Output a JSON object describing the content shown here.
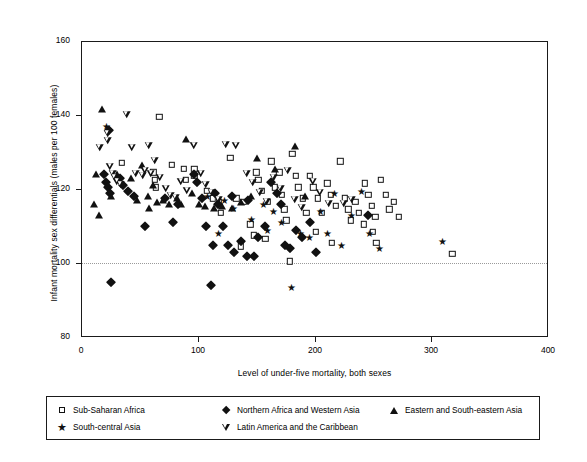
{
  "chart_data": {
    "type": "scatter",
    "title": "",
    "xlabel": "Level of under-five mortality, both sexes",
    "ylabel": "Infant mortality sex differentials (males per 100 females)",
    "xlim": [
      0,
      400
    ],
    "ylim": [
      80,
      160
    ],
    "xticks": [
      0,
      100,
      200,
      300,
      400
    ],
    "yticks": [
      80,
      100,
      120,
      140,
      160
    ],
    "grid": false,
    "reference_line": {
      "axis": "y",
      "value": 100,
      "style": "dotted",
      "color": "#9a9a9a"
    },
    "legend_position": "below-plot",
    "series": [
      {
        "name": "Sub-Saharan Africa",
        "marker": "open-square",
        "color": "#111111",
        "points": [
          [
            35,
            127
          ],
          [
            67,
            139.5
          ],
          [
            78,
            126.5
          ],
          [
            97,
            125.5
          ],
          [
            62,
            124.5
          ],
          [
            63,
            122.5
          ],
          [
            64,
            120.5
          ],
          [
            97,
            123.5
          ],
          [
            108,
            119.5
          ],
          [
            113,
            117.5
          ],
          [
            128,
            128.5
          ],
          [
            133,
            117.5
          ],
          [
            139,
            116.5
          ],
          [
            150,
            124.5
          ],
          [
            152,
            122.5
          ],
          [
            155,
            119.5
          ],
          [
            160,
            116.5
          ],
          [
            163,
            127.5
          ],
          [
            166,
            120.5
          ],
          [
            170,
            124.5
          ],
          [
            172,
            118.5
          ],
          [
            174,
            114.5
          ],
          [
            176,
            111.5
          ],
          [
            181,
            129.5
          ],
          [
            184,
            123.5
          ],
          [
            186,
            120.5
          ],
          [
            190,
            117.5
          ],
          [
            193,
            113.5
          ],
          [
            196,
            123.5
          ],
          [
            199,
            120.5
          ],
          [
            203,
            117.5
          ],
          [
            206,
            113.5
          ],
          [
            211,
            121.5
          ],
          [
            214,
            118.5
          ],
          [
            218,
            115.5
          ],
          [
            222,
            127.5
          ],
          [
            226,
            117.5
          ],
          [
            229,
            114.5
          ],
          [
            231,
            111.5
          ],
          [
            235,
            116.5
          ],
          [
            238,
            113.5
          ],
          [
            242,
            110.5
          ],
          [
            246,
            118.5
          ],
          [
            249,
            115.5
          ],
          [
            252,
            112.5
          ],
          [
            257,
            122.5
          ],
          [
            261,
            118.5
          ],
          [
            264,
            114.5
          ],
          [
            268,
            116.5
          ],
          [
            272,
            112.5
          ],
          [
            137,
            104.5
          ],
          [
            158,
            106.5
          ],
          [
            179,
            100.5
          ],
          [
            318,
            102.5
          ],
          [
            88,
            125.5
          ],
          [
            90,
            122.5
          ],
          [
            118,
            116.5
          ],
          [
            120,
            113.5
          ],
          [
            145,
            110.5
          ],
          [
            148,
            107.5
          ],
          [
            201,
            108.5
          ],
          [
            215,
            105.5
          ],
          [
            243,
            121.5
          ],
          [
            250,
            108.5
          ],
          [
            253,
            105.5
          ]
        ]
      },
      {
        "name": "South-central Asia",
        "marker": "star",
        "color": "#111111",
        "points": [
          [
            22,
            137
          ],
          [
            108,
            118
          ],
          [
            123,
            117
          ],
          [
            131,
            115
          ],
          [
            146,
            112
          ],
          [
            156,
            116
          ],
          [
            165,
            114
          ],
          [
            172,
            111
          ],
          [
            180,
            93.5
          ],
          [
            188,
            108
          ],
          [
            196,
            107
          ],
          [
            205,
            114
          ],
          [
            211,
            108
          ],
          [
            217,
            119
          ],
          [
            223,
            105
          ],
          [
            232,
            113
          ],
          [
            240,
            119.5
          ],
          [
            247,
            108
          ],
          [
            256,
            104
          ],
          [
            310,
            106
          ],
          [
            118,
            108
          ],
          [
            160,
            109
          ]
        ]
      },
      {
        "name": "Northern Africa and Western Asia",
        "marker": "filled-diamond",
        "color": "#111111",
        "points": [
          [
            20,
            124
          ],
          [
            21,
            122
          ],
          [
            23,
            120.5
          ],
          [
            25,
            119
          ],
          [
            24,
            136
          ],
          [
            26,
            95
          ],
          [
            33,
            123
          ],
          [
            36,
            121
          ],
          [
            40,
            119.5
          ],
          [
            45,
            118
          ],
          [
            55,
            110
          ],
          [
            72,
            117.5
          ],
          [
            79,
            111
          ],
          [
            83,
            116
          ],
          [
            97,
            124
          ],
          [
            99,
            122
          ],
          [
            104,
            117.5
          ],
          [
            107,
            110
          ],
          [
            111,
            94
          ],
          [
            113,
            105
          ],
          [
            117,
            116
          ],
          [
            122,
            110
          ],
          [
            126,
            105
          ],
          [
            131,
            103
          ],
          [
            137,
            106
          ],
          [
            142,
            102
          ],
          [
            148,
            102
          ],
          [
            152,
            107
          ],
          [
            158,
            110
          ],
          [
            163,
            122
          ],
          [
            168,
            119
          ],
          [
            171,
            116
          ],
          [
            175,
            105
          ],
          [
            179,
            104
          ],
          [
            184,
            109
          ],
          [
            189,
            107
          ],
          [
            196,
            111
          ],
          [
            201,
            103
          ],
          [
            246,
            113
          ],
          [
            115,
            119
          ],
          [
            129,
            118
          ],
          [
            143,
            117
          ]
        ]
      },
      {
        "name": "Eastern and South-eastern Asia",
        "marker": "filled-triangle-up",
        "color": "#111111",
        "points": [
          [
            13,
            124
          ],
          [
            11,
            116
          ],
          [
            15,
            113
          ],
          [
            18,
            141.5
          ],
          [
            31,
            124
          ],
          [
            43,
            123
          ],
          [
            52,
            126.5
          ],
          [
            57,
            118
          ],
          [
            62,
            121
          ],
          [
            65,
            116.5
          ],
          [
            70,
            117
          ],
          [
            75,
            116
          ],
          [
            82,
            117.5
          ],
          [
            90,
            133.5
          ],
          [
            95,
            119
          ],
          [
            101,
            116
          ],
          [
            106,
            115.5
          ],
          [
            114,
            115
          ],
          [
            121,
            115.5
          ],
          [
            129,
            115
          ],
          [
            137,
            116.5
          ],
          [
            146,
            118
          ],
          [
            151,
            128.5
          ],
          [
            166,
            125.5
          ],
          [
            183,
            131.5
          ],
          [
            192,
            118
          ],
          [
            26,
            118
          ],
          [
            48,
            117
          ],
          [
            58,
            115
          ],
          [
            86,
            116
          ]
        ]
      },
      {
        "name": "Latin America and the Caribbean",
        "marker": "open-triangle-down",
        "color": "#111111",
        "points": [
          [
            16,
            131
          ],
          [
            23,
            135
          ],
          [
            23,
            133
          ],
          [
            25,
            126
          ],
          [
            27,
            124
          ],
          [
            29,
            123
          ],
          [
            31,
            122
          ],
          [
            34,
            121
          ],
          [
            39,
            140
          ],
          [
            44,
            131
          ],
          [
            47,
            124
          ],
          [
            53,
            123.5
          ],
          [
            58,
            131.5
          ],
          [
            63,
            127.5
          ],
          [
            68,
            123
          ],
          [
            73,
            120
          ],
          [
            77,
            118
          ],
          [
            81,
            117.5
          ],
          [
            86,
            122
          ],
          [
            91,
            119.5
          ],
          [
            97,
            131.5
          ],
          [
            103,
            124
          ],
          [
            107,
            121
          ],
          [
            112,
            119
          ],
          [
            118,
            117
          ],
          [
            124,
            132
          ],
          [
            133,
            131.5
          ],
          [
            142,
            124
          ],
          [
            147,
            121.5
          ],
          [
            153,
            119
          ],
          [
            159,
            116.5
          ],
          [
            165,
            123
          ],
          [
            171,
            120
          ],
          [
            177,
            125
          ],
          [
            183,
            117
          ],
          [
            189,
            115
          ],
          [
            199,
            122
          ],
          [
            205,
            119
          ],
          [
            212,
            116
          ],
          [
            225,
            116
          ],
          [
            232,
            117
          ],
          [
            55,
            125
          ],
          [
            60,
            124
          ]
        ]
      }
    ]
  },
  "axes": {
    "y_ticks": [
      "160",
      "140",
      "120",
      "100",
      "80"
    ],
    "x_ticks": [
      "0",
      "100",
      "200",
      "300",
      "400"
    ],
    "x_title": "Level of under-five mortality, both sexes",
    "y_title": "Infant mortality sex differentials (males per 100 females)"
  },
  "legend": {
    "entries": [
      {
        "label": "Sub-Saharan Africa",
        "marker": "open-square"
      },
      {
        "label": "Northern Africa and Western Asia",
        "marker": "filled-diamond"
      },
      {
        "label": "Eastern and South-eastern Asia",
        "marker": "filled-triangle-up"
      },
      {
        "label": "South-central Asia",
        "marker": "star"
      },
      {
        "label": "Latin America and the Caribbean",
        "marker": "open-triangle-down"
      }
    ]
  }
}
